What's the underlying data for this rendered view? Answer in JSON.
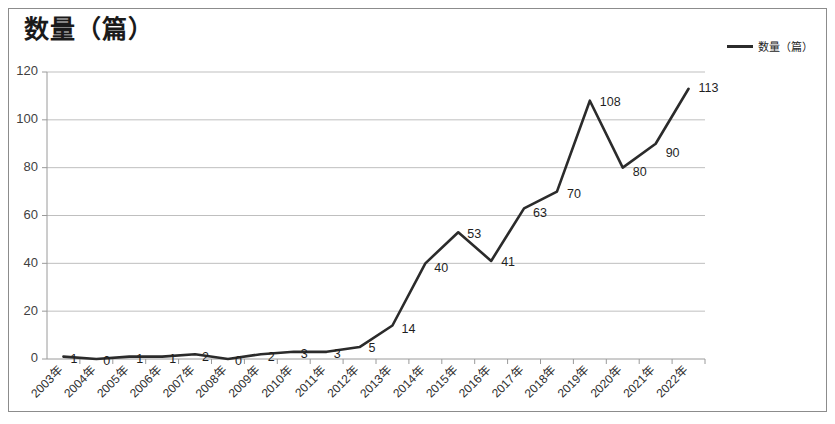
{
  "chart_title": "数量（篇）",
  "legend": {
    "entries": [
      {
        "label": "数量（篇）",
        "color": "#2b2b2b",
        "marker": "line"
      }
    ]
  },
  "colors": {
    "series_line": "#2b2b2b",
    "gridline": "#bfbfbf",
    "axis": "#9a9a9a",
    "frame_border": "#8c8c8c",
    "text": "#1f1f1f",
    "background": "#ffffff"
  },
  "chart_data": {
    "type": "line",
    "title": "数量（篇）",
    "subtitle": "",
    "xlabel": "",
    "ylabel": "",
    "grid": true,
    "legend_position": "top-right",
    "ylim": [
      0,
      120
    ],
    "y_ticks": [
      0,
      20,
      40,
      60,
      80,
      100,
      120
    ],
    "categories": [
      "2003年",
      "2004年",
      "2005年",
      "2006年",
      "2007年",
      "2008年",
      "2009年",
      "2010年",
      "2011年",
      "2012年",
      "2013年",
      "2014年",
      "2015年",
      "2016年",
      "2017年",
      "2018年",
      "2019年",
      "2020年",
      "2021年",
      "2022年"
    ],
    "series": [
      {
        "name": "数量（篇）",
        "color": "#2b2b2b",
        "values": [
          1,
          0,
          1,
          1,
          2,
          0,
          2,
          3,
          3,
          5,
          14,
          40,
          53,
          41,
          63,
          70,
          108,
          80,
          90,
          113
        ]
      }
    ],
    "data_labels": [
      "1",
      "0",
      "1",
      "1",
      "2",
      "0",
      "2",
      "3",
      "3",
      "5",
      "14",
      "40",
      "53",
      "41",
      "63",
      "70",
      "108",
      "80",
      "90",
      "113"
    ]
  }
}
